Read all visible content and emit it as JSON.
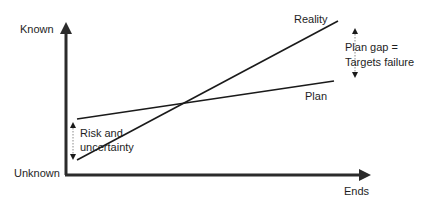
{
  "diagram": {
    "y_axis": {
      "top_label": "Known",
      "bottom_label": "Unknown"
    },
    "x_axis": {
      "label": "Ends"
    },
    "lines": [
      {
        "name": "Reality",
        "label": "Reality"
      },
      {
        "name": "Plan",
        "label": "Plan"
      }
    ],
    "annotations": {
      "plan_gap_line1": "Plan gap =",
      "plan_gap_line2": "Targets failure",
      "risk_line1": "Risk and",
      "risk_line2": "uncertainty"
    },
    "colors": {
      "line": "#1a1a1a",
      "axis": "#2b2b2b",
      "dotted": "#8a8a8a"
    }
  }
}
